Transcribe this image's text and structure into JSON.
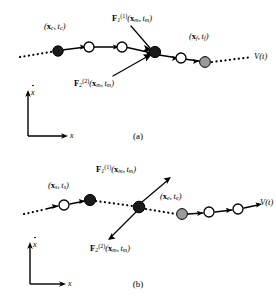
{
  "figure": {
    "type": "trajectory-diagram",
    "axis": {
      "x_label": "x",
      "y_label": "ẋ"
    },
    "flow_label": "V(t)"
  },
  "panels": [
    {
      "id": "a",
      "caption": "(a)",
      "endpoint_left": {
        "x": "x",
        "x_sub": "c",
        "t": "t",
        "t_sub": "c"
      },
      "endpoint_right": {
        "x": "x",
        "x_sub": "f",
        "t": "t",
        "t_sub": "f"
      },
      "force_upper": {
        "f": "F",
        "sub": "1",
        "sup": "(1)",
        "arg_x": "x",
        "arg_x_sub": "m",
        "arg_t": "t",
        "arg_t_sub": "m"
      },
      "force_lower": {
        "f": "F",
        "sub": "2",
        "sup": "(2)",
        "arg_x": "x",
        "arg_x_sub": "m",
        "arg_t": "t",
        "arg_t_sub": "m"
      },
      "force_direction": "inward",
      "nodes": [
        {
          "fill": "black",
          "label": "endpoint_left"
        },
        {
          "fill": "white"
        },
        {
          "fill": "white"
        },
        {
          "fill": "black",
          "label": "force_node"
        },
        {
          "fill": "white"
        },
        {
          "fill": "gray",
          "label": "endpoint_right"
        }
      ],
      "segments": [
        "dotted",
        "solid",
        "solid",
        "solid",
        "solid",
        "dotted"
      ]
    },
    {
      "id": "b",
      "caption": "(b)",
      "endpoint_left": {
        "x": "x",
        "x_sub": "s",
        "t": "t",
        "t_sub": "s"
      },
      "endpoint_right": {
        "x": "x",
        "x_sub": "e",
        "t": "t",
        "t_sub": "e"
      },
      "force_upper": {
        "f": "F",
        "sub": "1",
        "sup": "(1)",
        "arg_x": "x",
        "arg_x_sub": "m",
        "arg_t": "t",
        "arg_t_sub": "m"
      },
      "force_lower": {
        "f": "F",
        "sub": "2",
        "sup": "(2)",
        "arg_x": "x",
        "arg_x_sub": "m",
        "arg_t": "t",
        "arg_t_sub": "m"
      },
      "force_direction": "outward",
      "nodes": [
        {
          "fill": "white"
        },
        {
          "fill": "black",
          "label": "endpoint_left"
        },
        {
          "fill": "black",
          "label": "force_node"
        },
        {
          "fill": "gray",
          "label": "endpoint_right"
        },
        {
          "fill": "white"
        },
        {
          "fill": "white"
        }
      ],
      "segments": [
        "dotted",
        "solid",
        "dotted",
        "dotted",
        "solid",
        "solid"
      ]
    }
  ],
  "colors": {
    "stroke": "#000000",
    "node_black": "#1a1a1a",
    "node_white": "#ffffff",
    "node_gray": "#9a9a9a"
  }
}
